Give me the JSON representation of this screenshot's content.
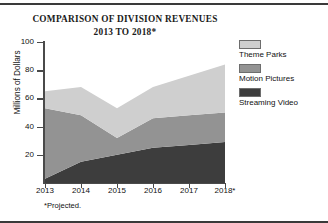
{
  "figure": {
    "title_line1": "COMPARISON OF DIVISION REVENUES",
    "title_line2": "2013 TO 2018*",
    "footnote": "*Projected."
  },
  "legend": {
    "position": "right",
    "entries": [
      {
        "label": "Theme Parks",
        "color": "#cfcfcf",
        "icon": "legend-swatch-icon"
      },
      {
        "label": "Motion Pictures",
        "color": "#939393",
        "icon": "legend-swatch-icon"
      },
      {
        "label": "Streaming Video",
        "color": "#3d3d3d",
        "icon": "legend-swatch-icon"
      }
    ]
  },
  "axes": {
    "ylabel": "Millions of Dollars",
    "yticks": [
      "20",
      "40",
      "60",
      "80",
      "100"
    ],
    "xticks": [
      "2013",
      "2014",
      "2015",
      "2016",
      "2017",
      "2018*"
    ]
  },
  "chart_data": {
    "type": "area",
    "stacked": true,
    "title": "COMPARISON OF DIVISION REVENUES 2013 TO 2018*",
    "xlabel": "",
    "ylabel": "Millions of Dollars",
    "categories": [
      "2013",
      "2014",
      "2015",
      "2016",
      "2017",
      "2018*"
    ],
    "x": [
      2013,
      2014,
      2015,
      2016,
      2017,
      2018
    ],
    "ylim": [
      0,
      100
    ],
    "xlim": [
      2013,
      2018
    ],
    "yticks": [
      20,
      40,
      60,
      80,
      100
    ],
    "grid": false,
    "legend_position": "right",
    "units": "Millions of Dollars",
    "annotations": [
      "*Projected."
    ],
    "series": [
      {
        "name": "Streaming Video",
        "color": "#3d3d3d",
        "values": [
          3,
          15,
          20,
          25,
          27,
          29
        ]
      },
      {
        "name": "Motion Pictures",
        "color": "#939393",
        "values": [
          50,
          33,
          12,
          21,
          21,
          21
        ]
      },
      {
        "name": "Theme Parks",
        "color": "#cfcfcf",
        "values": [
          12,
          20,
          21,
          22,
          28,
          34
        ]
      }
    ],
    "cumulative_totals": [
      65,
      68,
      53,
      68,
      76,
      84
    ]
  }
}
